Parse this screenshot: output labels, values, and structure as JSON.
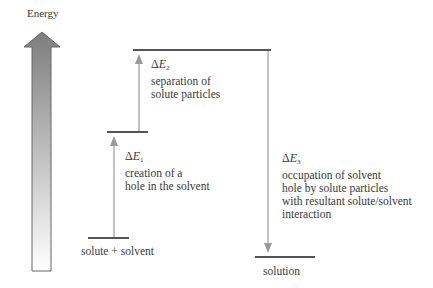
{
  "axis": {
    "label": "Energy"
  },
  "levels": [
    {
      "id": "solute_solvent",
      "label": "solute + solvent"
    },
    {
      "id": "hole",
      "label": ""
    },
    {
      "id": "separated",
      "label": ""
    },
    {
      "id": "solution",
      "label": "solution"
    }
  ],
  "steps": [
    {
      "symbol": "Δ",
      "var": "E",
      "sub": "1",
      "direction": "up",
      "desc": [
        "creation of a",
        "hole in the solvent"
      ]
    },
    {
      "symbol": "Δ",
      "var": "E",
      "sub": "2",
      "direction": "up",
      "desc": [
        "separation of",
        "solute particles"
      ]
    },
    {
      "symbol": "Δ",
      "var": "E",
      "sub": "3",
      "direction": "down",
      "desc": [
        "occupation of solvent",
        "hole by solute particles",
        "with resultant solute/solvent",
        "interaction"
      ]
    }
  ],
  "colors": {
    "level_line": "#555555",
    "arrow": "#9a9a9a",
    "big_arrow_top": "#7d7d7d",
    "big_arrow_bottom": "#ffffff"
  }
}
